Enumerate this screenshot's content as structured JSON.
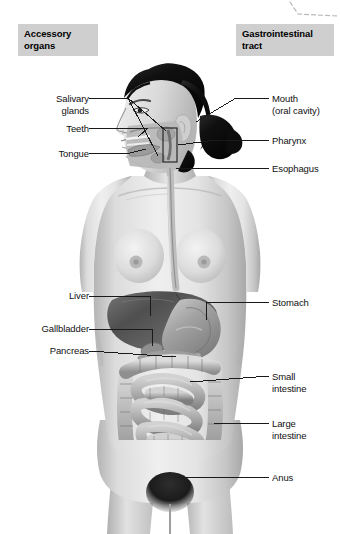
{
  "headers": [
    {
      "id": "accessory",
      "text": "Accessory\norgans"
    },
    {
      "id": "gi",
      "text": "Gastrointestinal\ntract"
    }
  ],
  "labels": {
    "salivary_glands": "Salivary\nglands",
    "teeth": "Teeth",
    "tongue": "Tongue",
    "liver": "Liver",
    "gallbladder": "Gallbladder",
    "pancreas": "Pancreas",
    "mouth": "Mouth\n(oral cavity)",
    "pharynx": "Pharynx",
    "esophagus": "Esophagus",
    "stomach": "Stomach",
    "small_intestine": "Small\nintestine",
    "large_intestine": "Large\nintestine",
    "anus": "Anus"
  },
  "colors": {
    "header_box_bg": "#cfcfcf",
    "text": "#111111",
    "leader_line": "#1a1a1a",
    "skin_light": "#e9e9e9",
    "skin_mid": "#cdcdcd",
    "skin_shadow": "#a9a9a9",
    "hair_dark": "#151515",
    "liver_dark": "#5d5d5d",
    "stomach_mid": "#9a9a9a",
    "intestine_light": "#c2c2c2",
    "intestine_shade": "#8c8c8c",
    "dashed_rule": "#b9b9b9"
  }
}
